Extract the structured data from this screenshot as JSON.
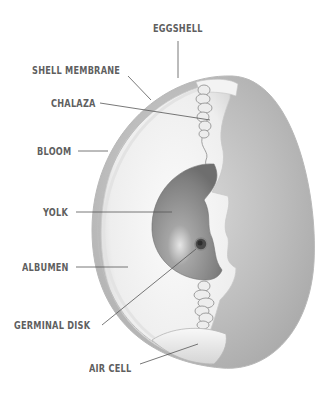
{
  "diagram": {
    "colors": {
      "label_text": "#5f5f5f",
      "leader_line": "#555555",
      "shell_outer": "#cfcfcf",
      "shell_fill": "#b9b9b9",
      "albumen": "#f2f2f2",
      "yolk": "#8c8c8c",
      "background": "#ffffff"
    },
    "labels": [
      {
        "id": "eggshell",
        "text": "EGGSHELL"
      },
      {
        "id": "shell-membrane",
        "text": "SHELL MEMBRANE"
      },
      {
        "id": "chalaza",
        "text": "CHALAZA"
      },
      {
        "id": "bloom",
        "text": "BLOOM"
      },
      {
        "id": "yolk",
        "text": "YOLK"
      },
      {
        "id": "albumen",
        "text": "ALBUMEN"
      },
      {
        "id": "germinal-disk",
        "text": "GERMINAL DISK"
      },
      {
        "id": "air-cell",
        "text": "AIR CELL"
      }
    ]
  }
}
